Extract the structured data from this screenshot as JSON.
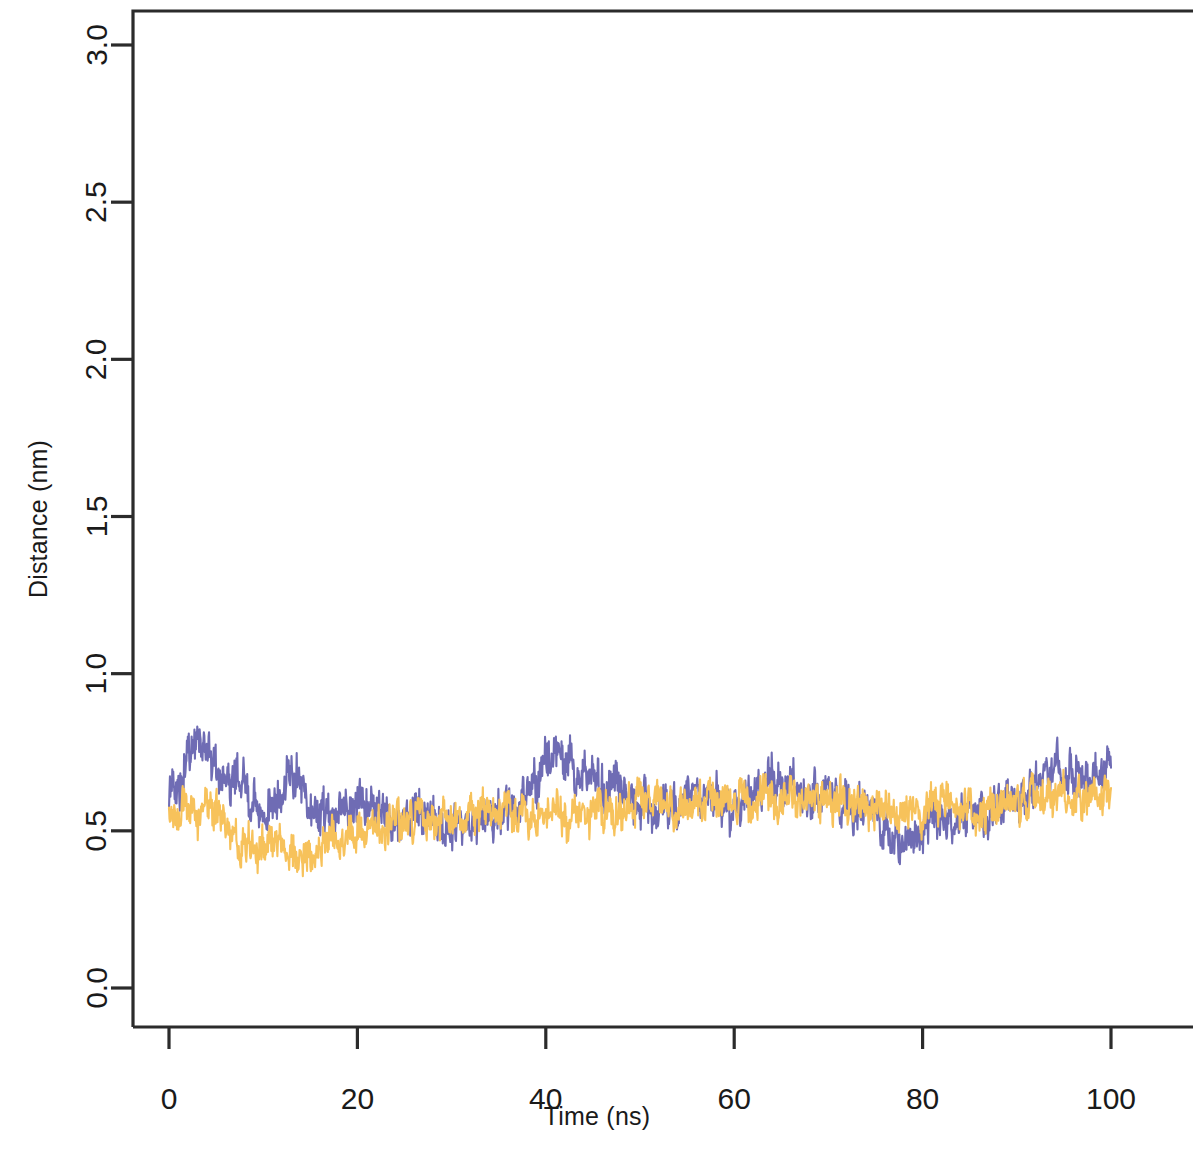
{
  "chart_data": {
    "type": "line",
    "title": "",
    "xlabel": "Time (ns)",
    "ylabel": "Distance (nm)",
    "xlim": [
      0,
      106
    ],
    "ylim": [
      0.0,
      3.12
    ],
    "xticks": [
      0,
      20,
      40,
      60,
      80,
      100
    ],
    "xticklabels": [
      "0",
      "20",
      "40",
      "60",
      "80",
      "100"
    ],
    "yticks": [
      0.0,
      0.5,
      1.0,
      1.5,
      2.0,
      2.5,
      3.0
    ],
    "yticklabels": [
      "0.0",
      "0.5",
      "1.0",
      "1.5",
      "2.0",
      "2.5",
      "3.0"
    ],
    "grid": false,
    "legend": "none",
    "box": true,
    "axis_color": "#2b2b2b",
    "series": [
      {
        "name": "series-purple",
        "color": "#6f6cb4",
        "noise_amplitude": 0.055,
        "seed": 1307,
        "n_points": 2000,
        "control_x": [
          0,
          1,
          2,
          3,
          4,
          5,
          6,
          7,
          8,
          9,
          10,
          11,
          12,
          13,
          14,
          15,
          16,
          17,
          18,
          19,
          20,
          22,
          24,
          26,
          28,
          30,
          32,
          34,
          36,
          38,
          40,
          41,
          42,
          43,
          44,
          45,
          46,
          47,
          48,
          49,
          50,
          52,
          54,
          56,
          58,
          60,
          62,
          64,
          66,
          68,
          70,
          72,
          74,
          76,
          78,
          80,
          82,
          84,
          86,
          88,
          90,
          92,
          94,
          96,
          98,
          100
        ],
        "control_y": [
          0.62,
          0.66,
          0.72,
          0.8,
          0.78,
          0.7,
          0.66,
          0.67,
          0.63,
          0.58,
          0.56,
          0.58,
          0.62,
          0.69,
          0.66,
          0.58,
          0.53,
          0.52,
          0.55,
          0.57,
          0.57,
          0.56,
          0.55,
          0.57,
          0.54,
          0.5,
          0.52,
          0.55,
          0.58,
          0.6,
          0.68,
          0.74,
          0.7,
          0.66,
          0.7,
          0.68,
          0.64,
          0.66,
          0.62,
          0.6,
          0.58,
          0.57,
          0.6,
          0.62,
          0.6,
          0.58,
          0.62,
          0.65,
          0.64,
          0.62,
          0.63,
          0.6,
          0.56,
          0.52,
          0.48,
          0.5,
          0.52,
          0.55,
          0.56,
          0.58,
          0.6,
          0.64,
          0.68,
          0.7,
          0.68,
          0.7
        ]
      },
      {
        "name": "series-orange",
        "color": "#f7c25b",
        "noise_amplitude": 0.048,
        "seed": 8821,
        "n_points": 2000,
        "control_x": [
          0,
          1,
          2,
          3,
          4,
          5,
          6,
          7,
          8,
          9,
          10,
          11,
          12,
          13,
          14,
          15,
          16,
          17,
          18,
          19,
          20,
          22,
          24,
          26,
          28,
          30,
          32,
          34,
          36,
          38,
          40,
          42,
          44,
          46,
          48,
          50,
          52,
          54,
          56,
          58,
          60,
          62,
          64,
          66,
          68,
          70,
          72,
          74,
          76,
          78,
          80,
          82,
          84,
          86,
          88,
          90,
          92,
          94,
          96,
          98,
          100
        ],
        "control_y": [
          0.55,
          0.58,
          0.58,
          0.56,
          0.55,
          0.54,
          0.52,
          0.48,
          0.45,
          0.44,
          0.45,
          0.46,
          0.46,
          0.44,
          0.42,
          0.44,
          0.45,
          0.47,
          0.48,
          0.49,
          0.5,
          0.52,
          0.53,
          0.54,
          0.53,
          0.52,
          0.54,
          0.55,
          0.56,
          0.55,
          0.54,
          0.56,
          0.56,
          0.55,
          0.57,
          0.6,
          0.6,
          0.58,
          0.59,
          0.6,
          0.6,
          0.61,
          0.6,
          0.59,
          0.6,
          0.6,
          0.59,
          0.58,
          0.56,
          0.54,
          0.56,
          0.58,
          0.57,
          0.56,
          0.58,
          0.6,
          0.61,
          0.6,
          0.62,
          0.61,
          0.6
        ]
      }
    ]
  },
  "axes": {
    "xlabel": "Time (ns)",
    "ylabel": "Distance (nm)"
  }
}
